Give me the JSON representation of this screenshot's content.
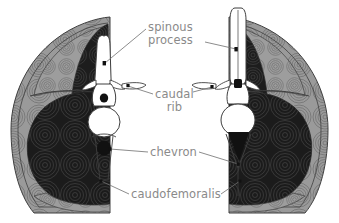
{
  "figure": {
    "type": "anatomical-cross-section-diagram",
    "background_color": "#ffffff",
    "view_count": 2,
    "views": [
      {
        "id": "left-section",
        "position": "left",
        "neural_spine": "short broad",
        "chevron_shape": "oval",
        "description": "tail cross section with broad low neural spine and oval chevron"
      },
      {
        "id": "right-section",
        "position": "right",
        "neural_spine": "tall slender",
        "chevron_shape": "triangular",
        "description": "tail cross section with tall slender neural spine and triangular chevron"
      }
    ],
    "tissue_colors": {
      "bone": "#ffffff",
      "caudofemoralis_muscle": "#1c1c1c",
      "epaxial_muscle": "#9a9a9a",
      "outer_rim": "#a8a8a8",
      "outline": "#404040",
      "fiber_lines": "#555555"
    }
  },
  "labels": [
    {
      "id": "spinous-process",
      "line1": "spinous",
      "line2": "process",
      "color": "#8a8a8a",
      "leader_targets": [
        "left-section",
        "right-section"
      ]
    },
    {
      "id": "caudal-rib",
      "line1": "caudal",
      "line2": "rib",
      "color": "#8a8a8a",
      "leader_targets": [
        "left-section",
        "right-section"
      ]
    },
    {
      "id": "chevron",
      "line1": "chevron",
      "line2": "",
      "color": "#8a8a8a",
      "leader_targets": [
        "left-section",
        "right-section"
      ]
    },
    {
      "id": "caudofemoralis",
      "line1": "caudofemoralis",
      "line2": "",
      "color": "#8a8a8a",
      "leader_targets": [
        "left-section",
        "right-section"
      ]
    }
  ]
}
